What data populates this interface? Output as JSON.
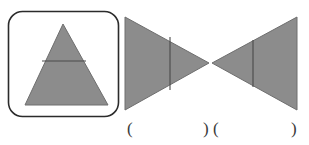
{
  "figure": {
    "title": "",
    "background_color": "#ffffff",
    "shape_fill": "#8c8c8c",
    "shape_stroke": "#6e6e6e",
    "divider_stroke": "#4a4a4a",
    "box_stroke": "#2b2b2b",
    "label_color": "#3a3a3a"
  },
  "panels": [
    {
      "name": "boxed-triangle-panel",
      "box": {
        "x": 8,
        "y": 11,
        "width": 110,
        "height": 105,
        "corner_radius": 14
      },
      "triangle": {
        "name": "upright-triangle",
        "apex": [
          63,
          24
        ],
        "base_left": [
          25,
          105
        ],
        "base_right": [
          108,
          105
        ],
        "divider_line": {
          "y": 61,
          "x1": 42,
          "x2": 86
        }
      }
    },
    {
      "name": "left-pointing-right-triangle",
      "triangle": {
        "top_left": [
          125,
          17
        ],
        "bottom_left": [
          125,
          110
        ],
        "tip": [
          209,
          63
        ],
        "divider_line": {
          "x": 170,
          "y1": 37,
          "y2": 90
        }
      }
    },
    {
      "name": "right-pointing-left-triangle",
      "triangle": {
        "tip": [
          212,
          63
        ],
        "top_right": [
          297,
          17
        ],
        "bottom_right": [
          297,
          110
        ],
        "divider_line": {
          "x": 253,
          "y1": 40,
          "y2": 87
        }
      }
    }
  ],
  "labels": [
    {
      "name": "paren-open-left",
      "text": "(",
      "x": 127,
      "y": 120
    },
    {
      "name": "paren-close-left",
      "text": ")",
      "x": 203,
      "y": 120
    },
    {
      "name": "paren-open-right",
      "text": "(",
      "x": 213,
      "y": 120
    },
    {
      "name": "paren-close-right",
      "text": ")",
      "x": 291,
      "y": 120
    }
  ]
}
